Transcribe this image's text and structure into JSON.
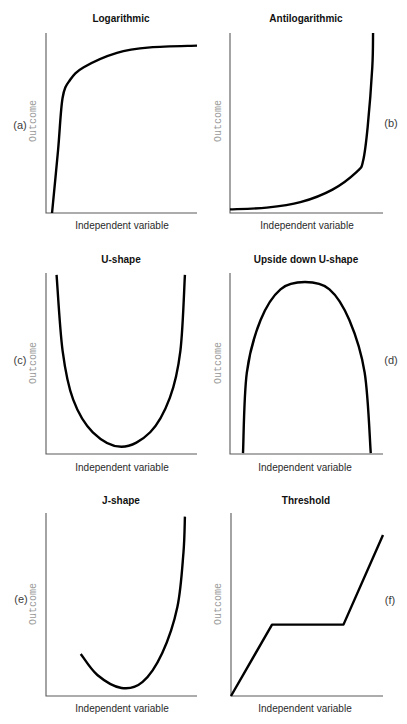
{
  "figure": {
    "background": "#ffffff",
    "line_color": "#000000",
    "axis_color": "#5a5a5a",
    "axis_label_color": "#9a9a9a"
  },
  "chart_data": [
    {
      "panel_label": "(a)",
      "type": "line",
      "title": "Logarithmic",
      "xlabel": "Independent variable",
      "ylabel": "Outcome",
      "xlim": [
        0,
        100
      ],
      "ylim": [
        0,
        100
      ],
      "grid": false,
      "ticks": false,
      "interpolation": "smooth",
      "points": [
        [
          4,
          0
        ],
        [
          8,
          35
        ],
        [
          11,
          64
        ],
        [
          16,
          74
        ],
        [
          25,
          81
        ],
        [
          47,
          89
        ],
        [
          69,
          92
        ],
        [
          100,
          93
        ]
      ]
    },
    {
      "panel_label": "(b)",
      "type": "line",
      "title": "Antilogarithmic",
      "xlabel": "Independent variable",
      "ylabel": "Outcome",
      "xlim": [
        0,
        100
      ],
      "ylim": [
        0,
        100
      ],
      "grid": false,
      "ticks": false,
      "interpolation": "smooth",
      "points": [
        [
          0,
          2
        ],
        [
          24,
          3
        ],
        [
          46,
          6
        ],
        [
          67,
          13
        ],
        [
          83,
          23
        ],
        [
          87,
          29
        ],
        [
          90,
          48
        ],
        [
          93,
          81
        ],
        [
          93.5,
          100
        ]
      ]
    },
    {
      "panel_label": "(c)",
      "type": "line",
      "title": "U-shape",
      "xlabel": "Independent variable",
      "ylabel": "Outcome",
      "xlim": [
        0,
        100
      ],
      "ylim": [
        0,
        100
      ],
      "grid": false,
      "ticks": false,
      "interpolation": "smooth",
      "points": [
        [
          7,
          99
        ],
        [
          11,
          57
        ],
        [
          18,
          30
        ],
        [
          31,
          12
        ],
        [
          50,
          4
        ],
        [
          69,
          12
        ],
        [
          82,
          31
        ],
        [
          89,
          57
        ],
        [
          92,
          99
        ]
      ]
    },
    {
      "panel_label": "(d)",
      "type": "line",
      "title": "Upside down U-shape",
      "xlabel": "Independent variable",
      "ylabel": "Outcome",
      "xlim": [
        0,
        100
      ],
      "ylim": [
        0,
        100
      ],
      "grid": false,
      "ticks": false,
      "interpolation": "smooth",
      "points": [
        [
          8.5,
          0.5
        ],
        [
          11,
          45
        ],
        [
          20,
          74
        ],
        [
          33,
          91
        ],
        [
          49,
          95
        ],
        [
          65,
          91
        ],
        [
          78,
          74
        ],
        [
          88,
          45
        ],
        [
          92,
          0.5
        ]
      ]
    },
    {
      "panel_label": "(e)",
      "type": "line",
      "title": "J-shape",
      "xlabel": "Independent variable",
      "ylabel": "Outcome",
      "xlim": [
        0,
        100
      ],
      "ylim": [
        0,
        100
      ],
      "grid": false,
      "ticks": false,
      "interpolation": "smooth",
      "points": [
        [
          23,
          23
        ],
        [
          34,
          11.5
        ],
        [
          50,
          4.4
        ],
        [
          64,
          7.7
        ],
        [
          77,
          23.5
        ],
        [
          87,
          48.6
        ],
        [
          91,
          78
        ],
        [
          92,
          98
        ]
      ]
    },
    {
      "panel_label": "(f)",
      "type": "line",
      "title": "Threshold",
      "xlabel": "Independent variable",
      "ylabel": "Outcome",
      "xlim": [
        0,
        100
      ],
      "ylim": [
        0,
        100
      ],
      "grid": false,
      "ticks": false,
      "interpolation": "linear",
      "points": [
        [
          0,
          0
        ],
        [
          27,
          39
        ],
        [
          74,
          39
        ],
        [
          100,
          88
        ]
      ]
    }
  ]
}
